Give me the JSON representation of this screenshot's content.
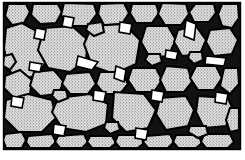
{
  "figure": {
    "kind": "scientific-illustration",
    "title": "Granular microstructure",
    "background_color": "#ffffff",
    "frame": {
      "stroke_color": "#000000",
      "stroke_width": 1.4,
      "x": 3,
      "y": 2,
      "width": 238,
      "height": 148
    },
    "style": {
      "grain_fill_color": "#dcdcdc",
      "grain_stipple_color": "#5a5a5a",
      "grain_outline_color": "#000000",
      "grain_outline_width": 2.1,
      "matrix_color": "#000000",
      "pore_color": "#ffffff",
      "stipple_density": "fine"
    },
    "counts": {
      "grains": 62,
      "pores": 18
    },
    "grains": [
      {
        "id": "g01",
        "cx": 26,
        "cy": 46,
        "rx": 21,
        "ry": 28,
        "rot": -22
      },
      {
        "id": "g02",
        "cx": 16,
        "cy": 14,
        "rx": 11,
        "ry": 9,
        "rot": 10
      },
      {
        "id": "g03",
        "cx": 44,
        "cy": 13,
        "rx": 15,
        "ry": 10,
        "rot": -6
      },
      {
        "id": "g04",
        "cx": 76,
        "cy": 15,
        "rx": 17,
        "ry": 12,
        "rot": 8
      },
      {
        "id": "g05",
        "cx": 110,
        "cy": 14,
        "rx": 14,
        "ry": 11,
        "rot": -10
      },
      {
        "id": "g06",
        "cx": 140,
        "cy": 13,
        "rx": 13,
        "ry": 10,
        "rot": 6
      },
      {
        "id": "g07",
        "cx": 168,
        "cy": 14,
        "rx": 14,
        "ry": 11,
        "rot": -4
      },
      {
        "id": "g08",
        "cx": 199,
        "cy": 13,
        "rx": 13,
        "ry": 10,
        "rot": 12
      },
      {
        "id": "g09",
        "cx": 228,
        "cy": 16,
        "rx": 10,
        "ry": 12,
        "rot": 0
      },
      {
        "id": "g10",
        "cx": 64,
        "cy": 46,
        "rx": 24,
        "ry": 22,
        "rot": 14
      },
      {
        "id": "g11",
        "cx": 112,
        "cy": 48,
        "rx": 26,
        "ry": 24,
        "rot": -8
      },
      {
        "id": "g12",
        "cx": 152,
        "cy": 40,
        "rx": 16,
        "ry": 17,
        "rot": 18
      },
      {
        "id": "g13",
        "cx": 182,
        "cy": 42,
        "rx": 15,
        "ry": 16,
        "rot": -12
      },
      {
        "id": "g14",
        "cx": 213,
        "cy": 40,
        "rx": 14,
        "ry": 15,
        "rot": 6
      },
      {
        "id": "g15",
        "cx": 234,
        "cy": 44,
        "rx": 8,
        "ry": 14,
        "rot": 0
      },
      {
        "id": "g16",
        "cx": 17,
        "cy": 82,
        "rx": 12,
        "ry": 13,
        "rot": -14
      },
      {
        "id": "g17",
        "cx": 46,
        "cy": 80,
        "rx": 16,
        "ry": 14,
        "rot": 10
      },
      {
        "id": "g18",
        "cx": 78,
        "cy": 78,
        "rx": 15,
        "ry": 13,
        "rot": -6
      },
      {
        "id": "g19",
        "cx": 110,
        "cy": 82,
        "rx": 14,
        "ry": 12,
        "rot": 16
      },
      {
        "id": "g20",
        "cx": 141,
        "cy": 76,
        "rx": 16,
        "ry": 14,
        "rot": -10
      },
      {
        "id": "g21",
        "cx": 172,
        "cy": 78,
        "rx": 15,
        "ry": 15,
        "rot": 8
      },
      {
        "id": "g22",
        "cx": 203,
        "cy": 76,
        "rx": 14,
        "ry": 13,
        "rot": -16
      },
      {
        "id": "g23",
        "cx": 230,
        "cy": 80,
        "rx": 10,
        "ry": 14,
        "rot": 0
      },
      {
        "id": "g24",
        "cx": 30,
        "cy": 114,
        "rx": 25,
        "ry": 19,
        "rot": -8
      },
      {
        "id": "g25",
        "cx": 82,
        "cy": 112,
        "rx": 27,
        "ry": 20,
        "rot": 10
      },
      {
        "id": "g26",
        "cx": 133,
        "cy": 110,
        "rx": 22,
        "ry": 21,
        "rot": -14
      },
      {
        "id": "g27",
        "cx": 176,
        "cy": 112,
        "rx": 19,
        "ry": 18,
        "rot": 12
      },
      {
        "id": "g28",
        "cx": 214,
        "cy": 110,
        "rx": 17,
        "ry": 17,
        "rot": -6
      },
      {
        "id": "g29",
        "cx": 14,
        "cy": 140,
        "rx": 10,
        "ry": 8,
        "rot": 0
      },
      {
        "id": "g30",
        "cx": 40,
        "cy": 142,
        "rx": 13,
        "ry": 8,
        "rot": 6
      },
      {
        "id": "g31",
        "cx": 70,
        "cy": 141,
        "rx": 14,
        "ry": 8,
        "rot": -6
      },
      {
        "id": "g32",
        "cx": 100,
        "cy": 142,
        "rx": 13,
        "ry": 8,
        "rot": 4
      },
      {
        "id": "g33",
        "cx": 128,
        "cy": 141,
        "rx": 12,
        "ry": 8,
        "rot": -4
      },
      {
        "id": "g34",
        "cx": 156,
        "cy": 142,
        "rx": 13,
        "ry": 8,
        "rot": 8
      },
      {
        "id": "g35",
        "cx": 186,
        "cy": 141,
        "rx": 13,
        "ry": 8,
        "rot": -8
      },
      {
        "id": "g36",
        "cx": 216,
        "cy": 142,
        "rx": 14,
        "ry": 8,
        "rot": 2
      },
      {
        "id": "g37",
        "cx": 234,
        "cy": 120,
        "rx": 8,
        "ry": 12,
        "rot": 0
      },
      {
        "id": "g38",
        "cx": 10,
        "cy": 62,
        "rx": 7,
        "ry": 9,
        "rot": 0
      },
      {
        "id": "g39",
        "cx": 96,
        "cy": 30,
        "rx": 9,
        "ry": 7,
        "rot": 12
      },
      {
        "id": "g40",
        "cx": 154,
        "cy": 60,
        "rx": 9,
        "ry": 8,
        "rot": -10
      },
      {
        "id": "g41",
        "cx": 196,
        "cy": 58,
        "rx": 8,
        "ry": 8,
        "rot": 0
      },
      {
        "id": "g42",
        "cx": 60,
        "cy": 96,
        "rx": 8,
        "ry": 7,
        "rot": 0
      },
      {
        "id": "g43",
        "cx": 112,
        "cy": 128,
        "rx": 9,
        "ry": 8,
        "rot": 0
      },
      {
        "id": "g44",
        "cx": 198,
        "cy": 132,
        "rx": 10,
        "ry": 9,
        "rot": 0
      }
    ],
    "pores": [
      {
        "id": "p01",
        "cx": 88,
        "cy": 62,
        "rx": 12,
        "ry": 8,
        "rot": -30
      },
      {
        "id": "p02",
        "cx": 36,
        "cy": 66,
        "rx": 7,
        "ry": 5,
        "rot": 20
      },
      {
        "id": "p03",
        "cx": 120,
        "cy": 74,
        "rx": 6,
        "ry": 9,
        "rot": 0
      },
      {
        "id": "p04",
        "cx": 190,
        "cy": 30,
        "rx": 5,
        "ry": 10,
        "rot": -20
      },
      {
        "id": "p05",
        "cx": 216,
        "cy": 60,
        "rx": 10,
        "ry": 5,
        "rot": 25
      },
      {
        "id": "p06",
        "cx": 60,
        "cy": 130,
        "rx": 6,
        "ry": 6,
        "rot": 0
      },
      {
        "id": "p07",
        "cx": 158,
        "cy": 96,
        "rx": 6,
        "ry": 7,
        "rot": 0
      },
      {
        "id": "p08",
        "cx": 100,
        "cy": 96,
        "rx": 5,
        "ry": 6,
        "rot": 0
      },
      {
        "id": "p09",
        "cx": 172,
        "cy": 56,
        "rx": 6,
        "ry": 5,
        "rot": 0
      },
      {
        "id": "p10",
        "cx": 126,
        "cy": 28,
        "rx": 5,
        "ry": 7,
        "rot": 10
      }
    ]
  }
}
